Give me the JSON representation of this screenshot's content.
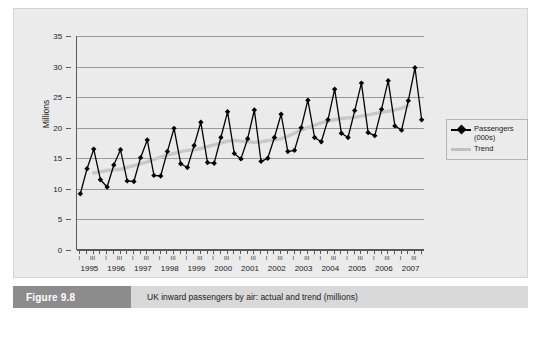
{
  "caption": {
    "tag": "Figure 9.8",
    "text": "UK inward passengers by air: actual and trend (millions)"
  },
  "legend": {
    "items": [
      {
        "label": "Passengers",
        "label2": "(000s)",
        "color": "#000000",
        "marker": "diamond"
      },
      {
        "label": "Trend",
        "label2": "",
        "color": "#c0c0c0",
        "marker": "line"
      }
    ]
  },
  "chart_data": {
    "type": "line",
    "title": "UK inward passengers by air: actual and trend (millions)",
    "xlabel": "",
    "ylabel": "Millions",
    "ylim": [
      0,
      35
    ],
    "ytick_labels": [
      "0",
      "5",
      "10",
      "15",
      "20",
      "25",
      "30",
      "35"
    ],
    "yticks": [
      0,
      5,
      10,
      15,
      20,
      25,
      30,
      35
    ],
    "grid": true,
    "legend_position": "right",
    "quarter_labels": [
      "I",
      "II",
      "III",
      "IV"
    ],
    "years": [
      "1995",
      "1996",
      "1997",
      "1998",
      "1999",
      "2000",
      "2001",
      "2002",
      "2003",
      "2004",
      "2005",
      "2006",
      "2007"
    ],
    "x": [
      "1995 I",
      "1995 II",
      "1995 III",
      "1995 IV",
      "1996 I",
      "1996 II",
      "1996 III",
      "1996 IV",
      "1997 I",
      "1997 II",
      "1997 III",
      "1997 IV",
      "1998 I",
      "1998 II",
      "1998 III",
      "1998 IV",
      "1999 I",
      "1999 II",
      "1999 III",
      "1999 IV",
      "2000 I",
      "2000 II",
      "2000 III",
      "2000 IV",
      "2001 I",
      "2001 II",
      "2001 III",
      "2001 IV",
      "2002 I",
      "2002 II",
      "2002 III",
      "2002 IV",
      "2003 I",
      "2003 II",
      "2003 III",
      "2003 IV",
      "2004 I",
      "2004 II",
      "2004 III",
      "2004 IV",
      "2005 I",
      "2005 II",
      "2005 III",
      "2005 IV",
      "2006 I",
      "2006 II",
      "2006 III",
      "2006 IV",
      "2007 I",
      "2007 II",
      "2007 III",
      "2007 IV"
    ],
    "series": [
      {
        "name": "Passengers (000s)",
        "color": "#000000",
        "marker": "diamond",
        "values": [
          9.2,
          13.3,
          16.5,
          11.5,
          10.3,
          13.9,
          16.4,
          11.3,
          11.2,
          15.1,
          18.0,
          12.2,
          12.1,
          16.1,
          19.9,
          14.1,
          13.5,
          17.1,
          20.9,
          14.3,
          14.2,
          18.4,
          22.6,
          15.8,
          14.9,
          18.2,
          22.9,
          14.5,
          15.0,
          18.4,
          22.2,
          16.1,
          16.3,
          20.0,
          24.5,
          18.4,
          17.7,
          21.3,
          26.3,
          19.1,
          18.4,
          22.8,
          27.3,
          19.2,
          18.7,
          23.0,
          27.7,
          20.3,
          19.6,
          24.4,
          29.8,
          21.3
        ]
      },
      {
        "name": "Trend",
        "color": "#c8c8c8",
        "marker": "line",
        "values": [
          null,
          null,
          12.6,
          12.8,
          13.0,
          13.1,
          13.2,
          13.5,
          13.8,
          14.1,
          14.4,
          14.8,
          15.2,
          15.5,
          15.8,
          16.1,
          16.3,
          16.4,
          16.6,
          16.9,
          17.2,
          17.5,
          17.8,
          17.9,
          17.8,
          17.7,
          17.6,
          17.7,
          17.9,
          18.0,
          18.2,
          18.6,
          19.1,
          19.6,
          20.0,
          20.4,
          20.8,
          21.1,
          21.3,
          21.5,
          21.6,
          21.7,
          21.9,
          22.1,
          22.3,
          22.5,
          22.7,
          22.9,
          23.2,
          23.6,
          null,
          null
        ]
      }
    ]
  }
}
